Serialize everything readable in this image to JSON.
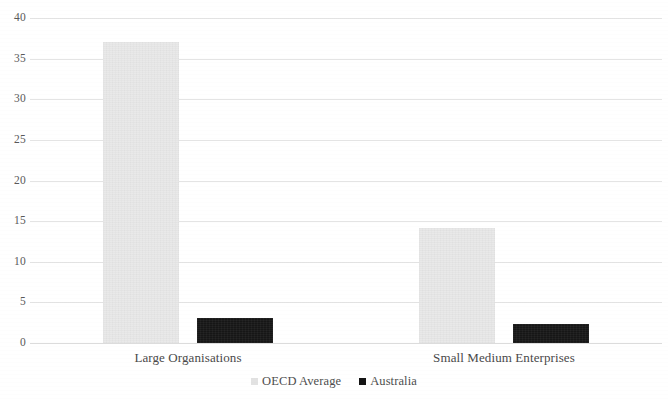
{
  "chart_data": {
    "type": "bar",
    "title": "",
    "subtitle": "",
    "xlabel": "",
    "ylabel": "",
    "categories": [
      "Large Organisations",
      "Small Medium Enterprises"
    ],
    "series": [
      {
        "name": "OECD Average",
        "color": "#e9e9e9",
        "values": [
          37,
          14.2
        ]
      },
      {
        "name": "Australia",
        "color": "#161616",
        "values": [
          3.1,
          2.4
        ]
      }
    ],
    "ylim": [
      0,
      40
    ],
    "yticks": [
      0,
      5,
      10,
      15,
      20,
      25,
      30,
      35,
      40
    ],
    "ytick_labels": [
      "0",
      "5",
      "10",
      "15",
      "20",
      "25",
      "30",
      "35",
      "40"
    ],
    "grid": true,
    "grid_axis": "y",
    "legend_position": "bottom",
    "axis_line_visible": false
  },
  "legend": {
    "items": [
      {
        "label": "OECD Average",
        "marker": "square-swatch-gray"
      },
      {
        "label": "Australia",
        "marker": "square-swatch-black"
      }
    ]
  }
}
